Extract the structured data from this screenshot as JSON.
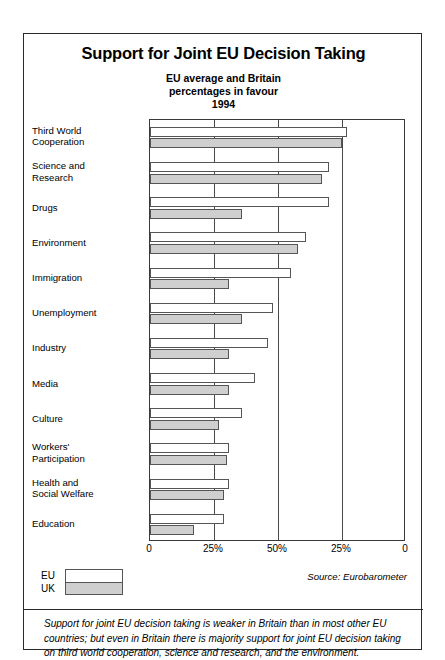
{
  "title": "Support for Joint EU Decision Taking",
  "subtitle_lines": [
    "EU average and Britain",
    "percentages in favour",
    "1994"
  ],
  "source": "Source: Eurobarometer",
  "legend": [
    {
      "key": "eu",
      "label": "EU"
    },
    {
      "key": "uk",
      "label": "UK"
    }
  ],
  "caption": "Support for joint EU decision taking is weaker in Britain than in most other EU countries; but even in Britain there is majority support for joint EU decision taking on third world cooperation, science and research, and the environment.",
  "axis": {
    "ticks": [
      {
        "label": "0",
        "pos": 0
      },
      {
        "label": "25%",
        "pos": 25
      },
      {
        "label": "50%",
        "pos": 50
      },
      {
        "label": "25%",
        "pos": 75
      },
      {
        "label": "0",
        "pos": 100
      }
    ],
    "gridlines": [
      0,
      25,
      50,
      75,
      100
    ]
  },
  "chart_data": {
    "type": "bar",
    "title": "Support for Joint EU Decision Taking",
    "subtitle": "EU average and Britain percentages in favour 1994",
    "orientation": "horizontal",
    "xlabel": "",
    "ylabel": "",
    "xlim": [
      0,
      100
    ],
    "axis_note": "Axis is mirrored: left edge 0%, centre 50%, right edge 0%. Bars are drawn from the left edge and measured against the left-hand scale.",
    "grid": true,
    "legend_position": "bottom-left",
    "categories": [
      "Third World\nCooperation",
      "Science and\nResearch",
      "Drugs",
      "Environment",
      "Immigration",
      "Unemployment",
      "Industry",
      "Media",
      "Culture",
      "Workers'\nParticipation",
      "Health and\nSocial Welfare",
      "Education"
    ],
    "series": [
      {
        "name": "EU",
        "color": "#ffffff",
        "values": [
          77,
          70,
          70,
          61,
          55,
          48,
          46,
          41,
          36,
          31,
          31,
          29
        ]
      },
      {
        "name": "UK",
        "color": "#cfcfcf",
        "values": [
          75,
          67,
          36,
          58,
          31,
          36,
          31,
          31,
          27,
          30,
          29,
          17
        ]
      }
    ]
  }
}
